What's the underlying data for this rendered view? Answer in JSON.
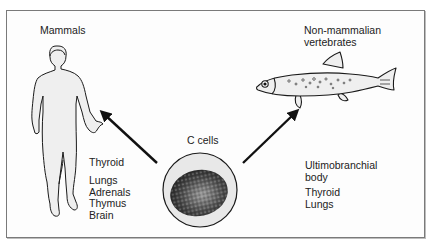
{
  "diagram": {
    "center": {
      "label": "C cells"
    },
    "left": {
      "title": "Mammals",
      "organs_primary": [
        "Thyroid"
      ],
      "organs_secondary": [
        "Lungs",
        "Adrenals",
        "Thymus",
        "Brain"
      ]
    },
    "right": {
      "title_lines": [
        "Non-mammalian",
        "vertebrates"
      ],
      "organs_primary": [
        "Ultimobranchial",
        "body"
      ],
      "organs_secondary": [
        "Thyroid",
        "Lungs"
      ]
    },
    "colors": {
      "outline": "#1a1a1a",
      "fill": "#ececec",
      "nucleus": "#555555",
      "frame": "#7a7a7a"
    }
  }
}
